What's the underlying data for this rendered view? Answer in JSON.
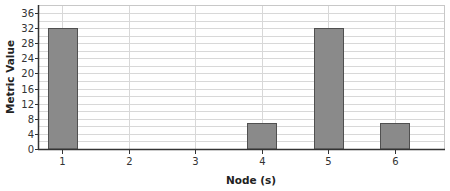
{
  "chart_data": {
    "type": "bar",
    "title": "",
    "xlabel": "Node (s)",
    "ylabel": "Metric Value",
    "categories": [
      "1",
      "2",
      "3",
      "4",
      "5",
      "6"
    ],
    "values": [
      32,
      0,
      0,
      7,
      32,
      7
    ],
    "ylim": [
      0,
      38
    ],
    "yticks": [
      0,
      4,
      8,
      12,
      16,
      20,
      24,
      28,
      32,
      36
    ],
    "ytick_labels": [
      "0",
      "4",
      "8",
      "12",
      "16",
      "20",
      "24",
      "28",
      "32",
      "36"
    ],
    "grid": {
      "horizontal_step": 2,
      "vertical_at_categories": true
    },
    "legend": null
  },
  "colors": {
    "bar_fill": "#8a8a8a",
    "bar_stroke": "#505050",
    "grid": "#d8d8d8",
    "axis": "#333333",
    "frame": "#c8c8c8"
  },
  "layout": {
    "plot_left": 38,
    "plot_right": 444,
    "plot_top": 5,
    "plot_bottom": 149,
    "first_category_x": 62,
    "category_spacing": 66.5,
    "bar_width": 29
  }
}
